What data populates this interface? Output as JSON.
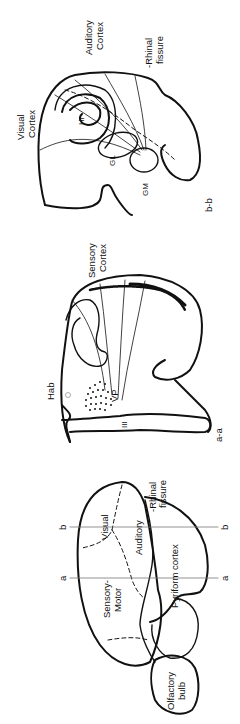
{
  "figure": {
    "orientation": "rotated 90 degrees counter-clockwise",
    "panels": [
      {
        "id": "lateral-view",
        "labels": {
          "section_a_left": "a",
          "section_a_right": "a",
          "section_b_left": "b",
          "section_b_right": "b",
          "visual": "Visual",
          "auditory": "Auditory",
          "sensory_motor_1": "Sensory-",
          "sensory_motor_2": "Motor",
          "pyriform": "Pyriform cortex",
          "rhinal_1": "-Rhinal",
          "rhinal_2": "fissure",
          "olfactory_1": "Olfactory",
          "olfactory_2": "bulb"
        }
      },
      {
        "id": "section-a-a",
        "labels": {
          "cortex_1": "Sensory",
          "cortex_2": "Cortex",
          "hab": "Hab",
          "vp": "VP",
          "ventricle": "III",
          "section": "a-a"
        }
      },
      {
        "id": "section-b-b",
        "labels": {
          "visual_1": "Visual",
          "visual_2": "Cortex",
          "auditory_1": "Auditory",
          "auditory_2": "Cortex",
          "rhinal_1": "-Rhinal",
          "rhinal_2": "fissure",
          "hi": "Hi",
          "gl": "GL",
          "gm": "GM",
          "section": "b-b"
        }
      }
    ]
  }
}
